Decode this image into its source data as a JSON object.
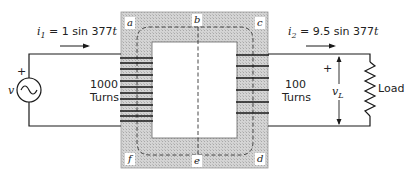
{
  "diagram": {
    "primary": {
      "current_label": "i₁ = 1 sin 377t",
      "current_symbol": "i",
      "current_sub": "1",
      "current_expr": " = 1 sin 377",
      "current_t": "t",
      "source_label": "v",
      "polarity": "+",
      "turns_count": "1000",
      "turns_word": "Turns"
    },
    "secondary": {
      "current_label": "i₂ = 9.5 sin 377t",
      "current_symbol": "i",
      "current_sub": "2",
      "current_expr": " = 9.5 sin 377",
      "current_t": "t",
      "voltage_label": "v_L",
      "voltage_symbol": "v",
      "voltage_sub": "L",
      "polarity": "+",
      "turns_count": "100",
      "turns_word": "Turns",
      "load_label": "Load"
    },
    "core": {
      "corner_labels": [
        "a",
        "b",
        "c",
        "d",
        "e",
        "f"
      ],
      "a": "a",
      "b": "b",
      "c": "c",
      "d": "d",
      "e": "e",
      "f": "f",
      "core_color": "#c8c8c8",
      "window_color": "#ffffff"
    },
    "colors": {
      "wire": "#1a1a1a",
      "text": "#222222"
    }
  }
}
